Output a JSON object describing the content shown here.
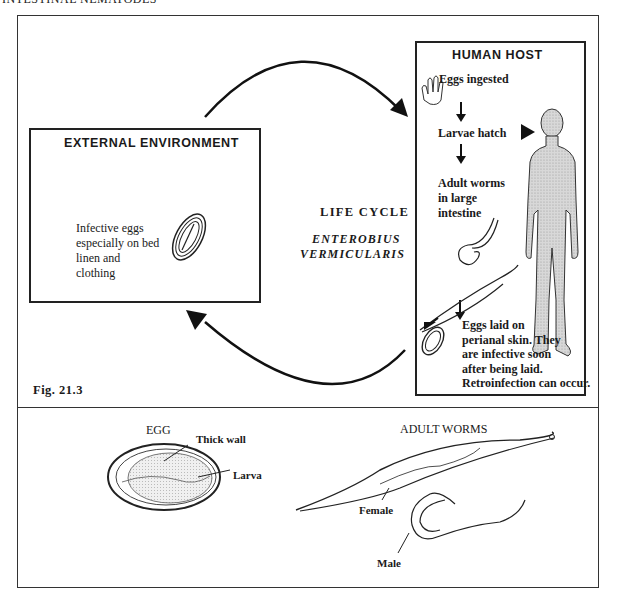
{
  "page_header": "INTESTINAL NEMATODES",
  "figure_label": "Fig. 21.3",
  "life_cycle": {
    "title": "LIFE CYCLE",
    "species_line1": "ENTEROBIUS",
    "species_line2": "VERMICULARIS"
  },
  "external_environment": {
    "title": "EXTERNAL ENVIRONMENT",
    "text_lines": [
      "Infective eggs",
      "especially on bed",
      "linen and",
      "clothing"
    ]
  },
  "human_host": {
    "title": "HUMAN HOST",
    "steps": [
      {
        "lines": [
          "Eggs ingested"
        ]
      },
      {
        "lines": [
          "Larvae hatch"
        ]
      },
      {
        "lines": [
          "Adult worms",
          "in large",
          "intestine"
        ]
      },
      {
        "lines": [
          "Eggs laid on",
          "perianal skin. They",
          "are infective soon",
          "after being laid.",
          "Retroinfection can occur."
        ]
      }
    ]
  },
  "bottom_panel": {
    "egg": {
      "title": "EGG",
      "labels": [
        "Thick wall",
        "Larva"
      ]
    },
    "adult_worms": {
      "title": "ADULT WORMS",
      "labels": [
        "Female",
        "Male"
      ]
    }
  }
}
